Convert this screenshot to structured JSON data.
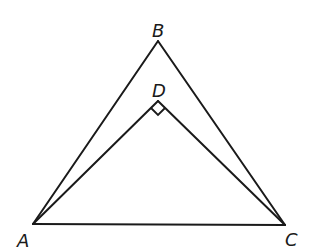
{
  "diagram": {
    "type": "geometry",
    "points": {
      "A": {
        "label": "A",
        "x": 33,
        "y": 224
      },
      "B": {
        "label": "B",
        "x": 158,
        "y": 41
      },
      "C": {
        "label": "C",
        "x": 285,
        "y": 225
      },
      "D": {
        "label": "D",
        "x": 158,
        "y": 101
      }
    },
    "segments": [
      "AB",
      "BC",
      "CA",
      "AD",
      "DC"
    ],
    "right_angle_marker": {
      "at": "D",
      "between": [
        "A",
        "C"
      ]
    },
    "labels": {
      "A": "A",
      "B": "B",
      "C": "C",
      "D": "D"
    },
    "stroke_color": "#1a1a1a",
    "background_color": "#ffffff"
  }
}
